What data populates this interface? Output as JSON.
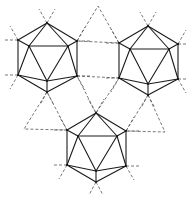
{
  "figure": {
    "icosahedra": [
      {
        "id": "top-left"
      },
      {
        "id": "top-right"
      },
      {
        "id": "bottom"
      }
    ],
    "connector_triangles": [
      {
        "id": "top-between",
        "style": "dashed"
      },
      {
        "id": "middle",
        "style": "dashed"
      },
      {
        "id": "left-lower",
        "style": "dashed"
      },
      {
        "id": "right-lower",
        "style": "dashed"
      }
    ],
    "colors": {
      "line": "#1a1a1a",
      "dash": "#555555",
      "background": "#ffffff"
    }
  }
}
